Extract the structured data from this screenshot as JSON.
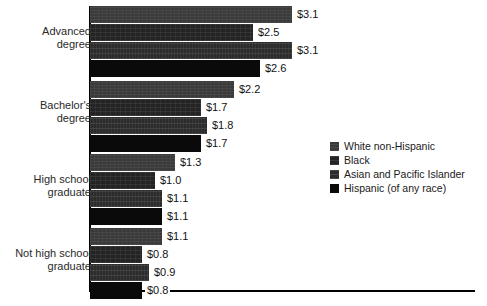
{
  "chart_data": {
    "type": "bar",
    "orientation": "horizontal",
    "title": "",
    "subtitle": "",
    "xlabel": "",
    "ylabel": "",
    "grid": false,
    "legend_position": "middle-right",
    "axis": {
      "x_visible_line": true,
      "y_visible_line": true,
      "x_tick_labels": [],
      "y_tick_labels": [
        "Advanced degree",
        "Bachelor's degree",
        "High school graduate",
        "Not high school graduate"
      ],
      "xlim": [
        0,
        5.9
      ],
      "value_prefix": "$"
    },
    "categories": [
      "Advanced degree",
      "Bachelor's degree",
      "High school graduate",
      "Not high school graduate"
    ],
    "category_lines": [
      [
        "Advanced",
        "degree"
      ],
      [
        "Bachelor's",
        "degree"
      ],
      [
        "High school",
        "graduate"
      ],
      [
        "Not high school",
        "graduate"
      ]
    ],
    "series": [
      {
        "name": "White non-Hispanic",
        "color": "#3a3a3a",
        "values": [
          3.1,
          2.2,
          1.3,
          1.1
        ],
        "labels": [
          "$3.1",
          "$2.2",
          "$1.3",
          "$1.1"
        ]
      },
      {
        "name": "Black",
        "color": "#242424",
        "values": [
          2.5,
          1.7,
          1.0,
          0.8
        ],
        "labels": [
          "$2.5",
          "$1.7",
          "$1.0",
          "$0.8"
        ]
      },
      {
        "name": "Asian and Pacific Islander",
        "color": "#2c2c2c",
        "values": [
          3.1,
          1.8,
          1.1,
          0.9
        ],
        "labels": [
          "$3.1",
          "$1.8",
          "$1.1",
          "$0.9"
        ]
      },
      {
        "name": "Hispanic (of any race)",
        "color": "#0a0a0a",
        "values": [
          2.6,
          1.7,
          1.1,
          0.8
        ],
        "labels": [
          "$2.6",
          "$1.7",
          "$1.1",
          "$0.8"
        ]
      }
    ]
  },
  "legend": {
    "items": [
      {
        "label": "White non-Hispanic"
      },
      {
        "label": "Black"
      },
      {
        "label": "Asian and Pacific Islander"
      },
      {
        "label": "Hispanic (of any race)"
      }
    ]
  }
}
